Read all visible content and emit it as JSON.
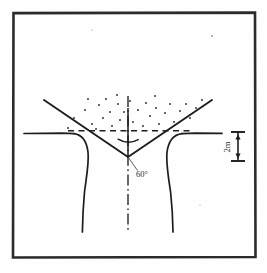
{
  "figure": {
    "name": "excavation-slope-cross-section",
    "background_color": "#fefefe",
    "line_color": "#1d1d1d",
    "border": {
      "name": "figure-frame",
      "color": "#2b2b2b",
      "x": 12,
      "y": 12,
      "width": 244,
      "height": 246,
      "stroke_width": 2.6
    },
    "labels": {
      "angle": "60°",
      "dimension": "2m"
    },
    "geometry": {
      "apex": {
        "x": 128,
        "y": 157
      },
      "left_diagonal": {
        "x1": 44,
        "y1": 100,
        "x2": 128,
        "y2": 157
      },
      "right_diagonal": {
        "x1": 212,
        "y1": 100,
        "x2": 128,
        "y2": 157
      },
      "ground_line_y": 133,
      "dashed_line_y": 131,
      "left_ground_x1": 24,
      "right_ground_x2": 222,
      "left_curve_bottom_x": 82,
      "right_curve_bottom_x": 173,
      "curve_bottom_y": 232,
      "centerline_top_y": 96,
      "centerline_bottom_y": 232
    },
    "dimension_line": {
      "x": 238,
      "y_top": 132,
      "y_bottom": 161,
      "tick_half_width": 7,
      "label": "2m",
      "label_rotation": -90
    },
    "angle_arc": {
      "center_x": 128,
      "center_y": 157,
      "radius": 20,
      "label": "60°",
      "label_x": 136,
      "label_y": 176
    },
    "dots": [
      {
        "x": 74,
        "y": 118
      },
      {
        "x": 85,
        "y": 110
      },
      {
        "x": 92,
        "y": 124
      },
      {
        "x": 99,
        "y": 105
      },
      {
        "x": 103,
        "y": 118
      },
      {
        "x": 96,
        "y": 129
      },
      {
        "x": 110,
        "y": 112
      },
      {
        "x": 112,
        "y": 126
      },
      {
        "x": 106,
        "y": 99
      },
      {
        "x": 118,
        "y": 104
      },
      {
        "x": 120,
        "y": 120
      },
      {
        "x": 124,
        "y": 112
      },
      {
        "x": 130,
        "y": 101
      },
      {
        "x": 133,
        "y": 122
      },
      {
        "x": 138,
        "y": 110
      },
      {
        "x": 143,
        "y": 126
      },
      {
        "x": 146,
        "y": 103
      },
      {
        "x": 150,
        "y": 116
      },
      {
        "x": 156,
        "y": 108
      },
      {
        "x": 159,
        "y": 124
      },
      {
        "x": 165,
        "y": 113
      },
      {
        "x": 170,
        "y": 104
      },
      {
        "x": 174,
        "y": 122
      },
      {
        "x": 180,
        "y": 111
      },
      {
        "x": 186,
        "y": 104
      },
      {
        "x": 190,
        "y": 118
      },
      {
        "x": 196,
        "y": 108
      },
      {
        "x": 88,
        "y": 99
      },
      {
        "x": 128,
        "y": 131
      },
      {
        "x": 202,
        "y": 100
      },
      {
        "x": 68,
        "y": 128
      },
      {
        "x": 117,
        "y": 95
      },
      {
        "x": 155,
        "y": 96
      }
    ],
    "stray_marks": [
      {
        "x": 212,
        "y": 36,
        "r": 0.9
      },
      {
        "x": 92,
        "y": 30,
        "r": 0.6
      },
      {
        "x": 200,
        "y": 205,
        "r": 0.5
      }
    ]
  }
}
